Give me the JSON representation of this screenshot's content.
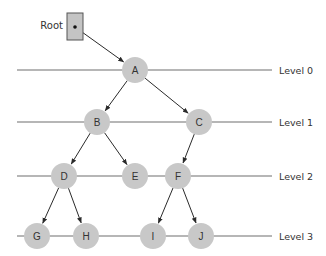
{
  "diagram": {
    "type": "tree-levels",
    "root_label": "Root",
    "levels": [
      {
        "label": "Level 0",
        "y": 70
      },
      {
        "label": "Level 1",
        "y": 122
      },
      {
        "label": "Level 2",
        "y": 176
      },
      {
        "label": "Level 3",
        "y": 236
      }
    ],
    "nodes": [
      {
        "id": "A",
        "label": "A",
        "x": 135,
        "y": 70
      },
      {
        "id": "B",
        "label": "B",
        "x": 97,
        "y": 122
      },
      {
        "id": "C",
        "label": "C",
        "x": 199,
        "y": 122
      },
      {
        "id": "D",
        "label": "D",
        "x": 64,
        "y": 176
      },
      {
        "id": "E",
        "label": "E",
        "x": 135,
        "y": 176
      },
      {
        "id": "F",
        "label": "F",
        "x": 178,
        "y": 176
      },
      {
        "id": "G",
        "label": "G",
        "x": 37,
        "y": 236
      },
      {
        "id": "H",
        "label": "H",
        "x": 86,
        "y": 236
      },
      {
        "id": "I",
        "label": "I",
        "x": 153,
        "y": 236
      },
      {
        "id": "J",
        "label": "J",
        "x": 201,
        "y": 236
      }
    ],
    "edges": [
      [
        "A",
        "B"
      ],
      [
        "A",
        "C"
      ],
      [
        "B",
        "D"
      ],
      [
        "B",
        "E"
      ],
      [
        "C",
        "F"
      ],
      [
        "D",
        "G"
      ],
      [
        "D",
        "H"
      ],
      [
        "F",
        "I"
      ],
      [
        "F",
        "J"
      ]
    ],
    "colors": {
      "node_fill": "#c8c8c8",
      "root_box_fill": "#c4c4c4",
      "line": "#6e6e6e",
      "edge": "#2a2a2a"
    }
  }
}
